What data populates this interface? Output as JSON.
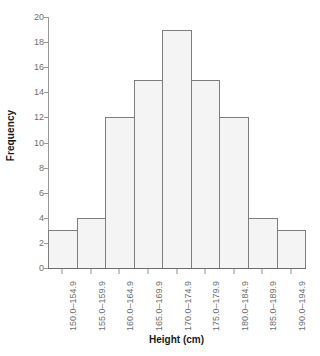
{
  "chart_data": {
    "type": "bar",
    "title": "",
    "xlabel": "Height (cm)",
    "ylabel": "Frequency",
    "categories": [
      "150.0-154.9",
      "155.0-159.9",
      "160.0-164.9",
      "165.0-169.9",
      "170.0-174.9",
      "175.0-179.9",
      "180.0-184.9",
      "185.0-189.9",
      "190.0-194.9"
    ],
    "values": [
      3,
      4,
      12,
      15,
      19,
      15,
      12,
      4,
      3
    ],
    "ylim": [
      0,
      20
    ],
    "yticks": [
      0,
      2,
      4,
      6,
      8,
      10,
      12,
      14,
      16,
      18,
      20
    ],
    "ytick_labels": [
      "0",
      "2",
      "4",
      "6",
      "8",
      "10",
      "12",
      "14",
      "16",
      "18",
      "20"
    ],
    "grid": false,
    "legend": false,
    "bar_fill_color": "#f4f4f4",
    "bar_border_color": "#7d7d7d",
    "axis_color": "#8f8f8f",
    "tick_label_color": "#6f6f6f",
    "axis_title_color": "#1a1a1a",
    "background_color": "#ffffff"
  }
}
